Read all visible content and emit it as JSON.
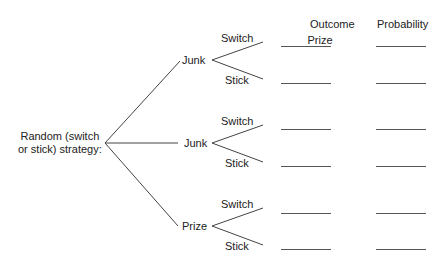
{
  "headers": {
    "outcome": "Outcome",
    "probability": "Probability"
  },
  "root": {
    "label_line1": "Random (switch",
    "label_line2": "or stick) strategy:"
  },
  "branches": [
    {
      "label": "Junk",
      "options": [
        {
          "label": "Switch",
          "outcome": "Prize",
          "probability": ""
        },
        {
          "label": "Stick",
          "outcome": "",
          "probability": ""
        }
      ]
    },
    {
      "label": "Junk",
      "options": [
        {
          "label": "Switch",
          "outcome": "",
          "probability": ""
        },
        {
          "label": "Stick",
          "outcome": "",
          "probability": ""
        }
      ]
    },
    {
      "label": "Prize",
      "options": [
        {
          "label": "Switch",
          "outcome": "",
          "probability": ""
        },
        {
          "label": "Stick",
          "outcome": "",
          "probability": ""
        }
      ]
    }
  ]
}
